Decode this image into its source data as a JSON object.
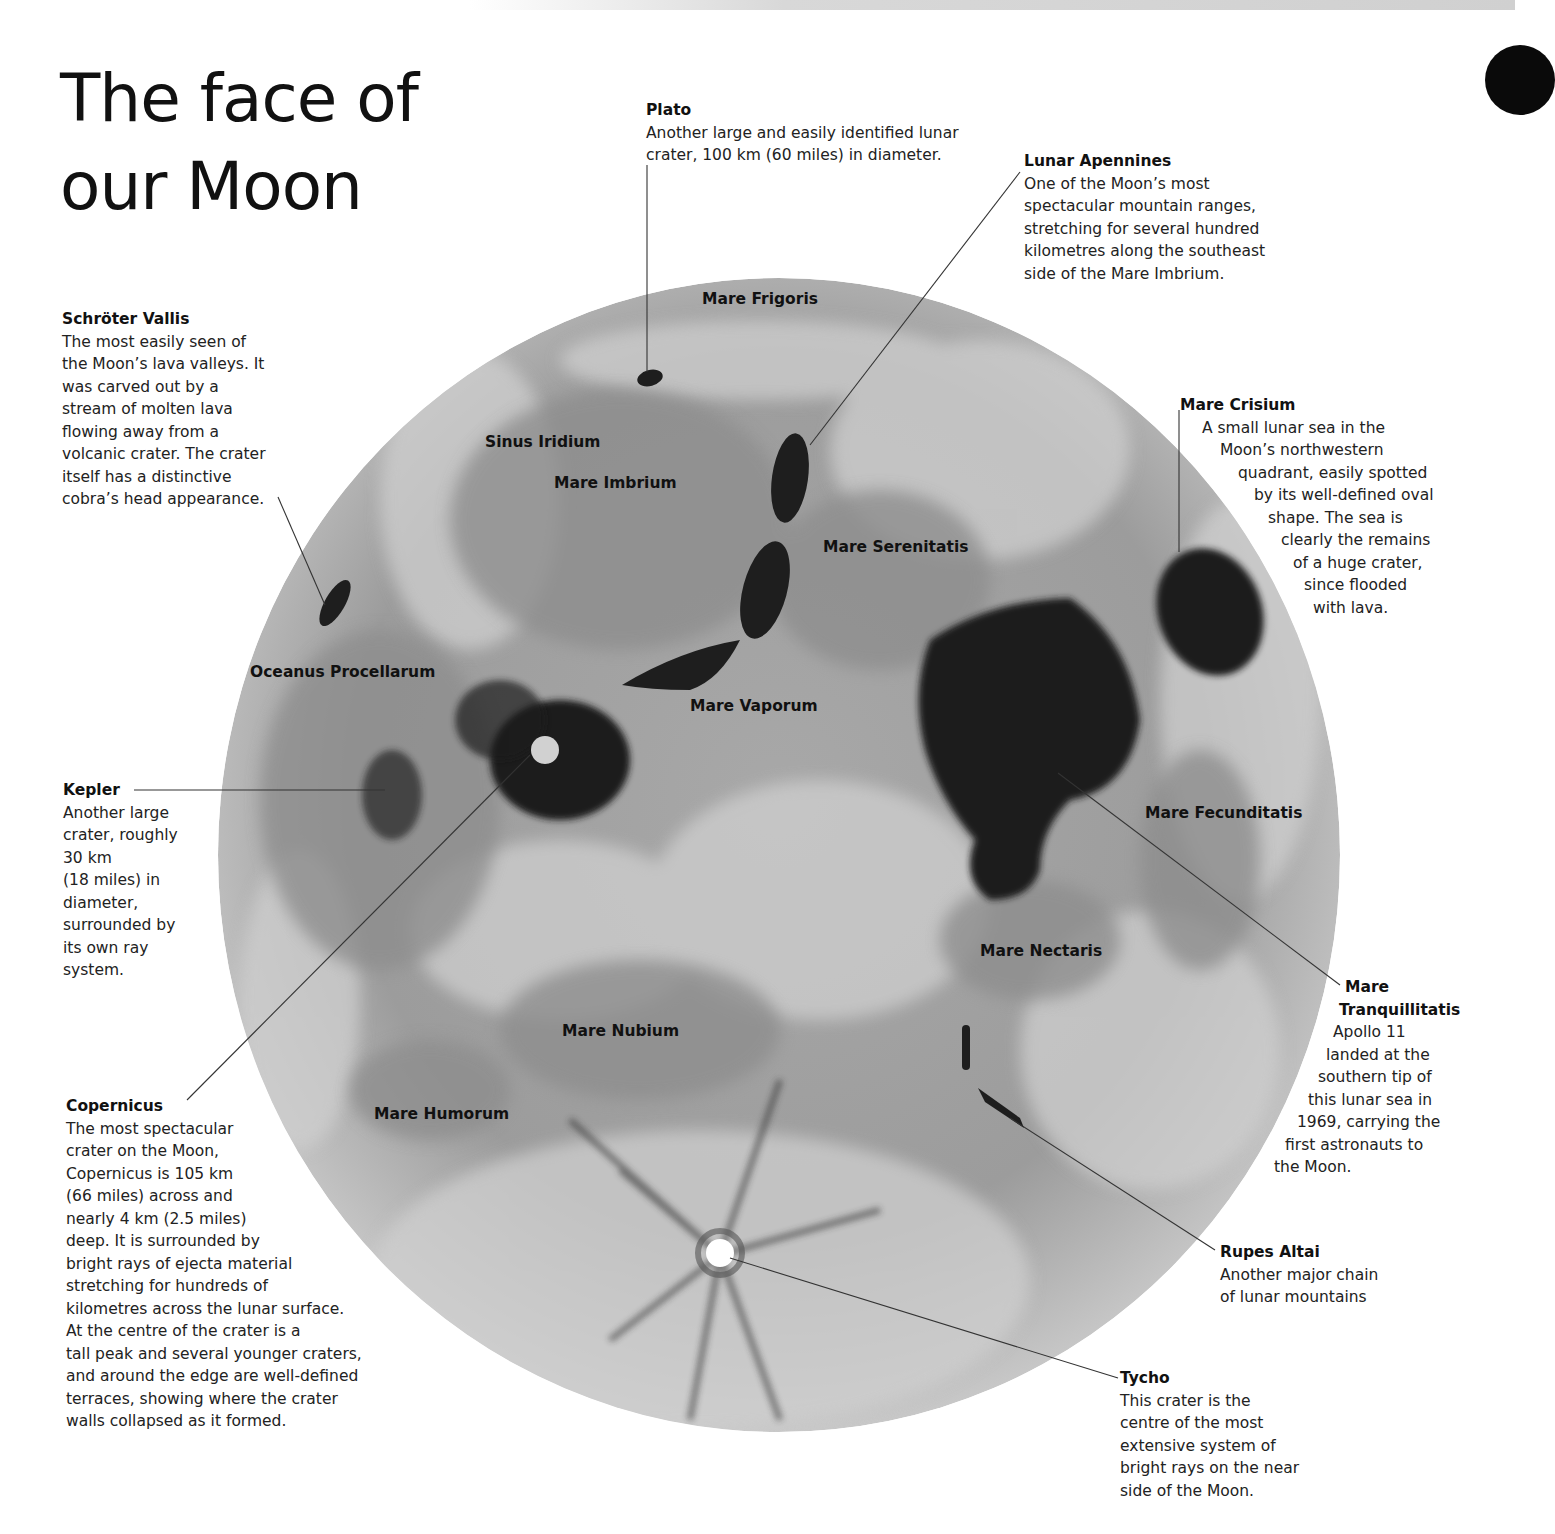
{
  "title": {
    "line1": "The face of",
    "line2": "our Moon"
  },
  "moon_labels": [
    {
      "id": "mare-frigoris",
      "text": "Mare Frigoris"
    },
    {
      "id": "sinus-iridium",
      "text": "Sinus Iridium"
    },
    {
      "id": "mare-imbrium",
      "text": "Mare Imbrium"
    },
    {
      "id": "mare-serenitatis",
      "text": "Mare Serenitatis"
    },
    {
      "id": "oceanus-procellarum",
      "text": "Oceanus Procellarum"
    },
    {
      "id": "mare-vaporum",
      "text": "Mare Vaporum"
    },
    {
      "id": "mare-fecunditatis",
      "text": "Mare Fecunditatis"
    },
    {
      "id": "mare-nectaris",
      "text": "Mare Nectaris"
    },
    {
      "id": "mare-nubium",
      "text": "Mare Nubium"
    },
    {
      "id": "mare-humorum",
      "text": "Mare Humorum"
    }
  ],
  "annotations": {
    "plato": {
      "heading": "Plato",
      "body": "Another large and easily identified lunar\ncrater, 100 km (60 miles) in diameter."
    },
    "lunar_apennines": {
      "heading": "Lunar Apennines",
      "body": "One of the Moon’s most\nspectacular mountain ranges,\nstretching for several hundred\nkilometres along the southeast\nside of the Mare Imbrium."
    },
    "schroter_vallis": {
      "heading": "Schröter Vallis",
      "body": "The most easily seen of\nthe Moon’s lava valleys. It\nwas carved out by a\nstream of molten lava\nflowing away from a\nvolcanic crater. The crater\nitself has a distinctive\ncobra’s head appearance."
    },
    "mare_crisium": {
      "heading": "Mare Crisium",
      "lines": [
        "A small lunar sea in the",
        "Moon’s northwestern",
        "quadrant, easily spotted",
        "by its well-defined oval",
        "shape. The sea is",
        "clearly the remains",
        "of a huge crater,",
        "since flooded",
        "with lava."
      ]
    },
    "kepler": {
      "heading": "Kepler",
      "body": "Another large\ncrater, roughly\n30 km\n(18 miles) in\ndiameter,\nsurrounded by\nits own ray\nsystem."
    },
    "mare_tranquillitatis": {
      "heading1": "Mare",
      "heading2": "Tranquillitatis",
      "lines": [
        "Apollo 11",
        "landed at the",
        "southern tip of",
        "this lunar sea in",
        "1969, carrying the",
        "first astronauts to",
        "the Moon."
      ]
    },
    "copernicus": {
      "heading": "Copernicus",
      "body": "The most spectacular\ncrater on the Moon,\nCopernicus is 105 km\n(66 miles) across and\nnearly 4 km (2.5 miles)\ndeep. It is surrounded by\nbright rays of ejecta material\nstretching for hundreds of\nkilometres across the lunar surface.\nAt the centre of the crater is a\ntall peak and several younger craters,\nand around the edge are well-defined\nterraces, showing where the crater\nwalls collapsed as it formed."
    },
    "rupes_altai": {
      "heading": "Rupes Altai",
      "body": "Another major chain\nof lunar mountains"
    },
    "tycho": {
      "heading": "Tycho",
      "body": "This crater is the\ncentre of the most\nextensive system of\nbright rays on the near\nside of the Moon."
    }
  },
  "colors": {
    "moon_base": "#9a9a9a",
    "moon_light": "#d4d4d4",
    "maria_dark": "#1e1e1e",
    "text": "#1a1a1a",
    "leader_line": "#333333"
  }
}
